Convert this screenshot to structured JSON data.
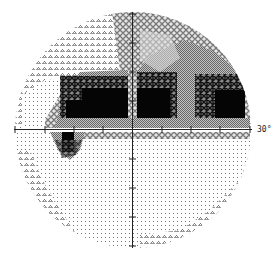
{
  "plot": {
    "type": "visual-field-greyscale",
    "scale_label": "30°",
    "center": {
      "x": 133,
      "y": 130
    },
    "radius": 118,
    "axis_colors": {
      "axis": "#222222"
    },
    "ticks_px": [
      -116,
      -87,
      -58,
      -29,
      29,
      58,
      87,
      116
    ],
    "tone_colors": {
      "blank": "#ffffff",
      "dots_sparse": "#bdbdbd",
      "dots": "#8a8a8a",
      "triangles": "#8c8c8c",
      "cross_hatch": "#9a9a9a",
      "grey_mid": "#8f8f8f",
      "grey_dark": "#6a6a6a",
      "dark_stars": "#2a2a2a",
      "black": "#050505"
    },
    "regions": [
      {
        "tone": "triangles",
        "shape": "upper-left-periphery"
      },
      {
        "tone": "dots",
        "shape": "lower-hemifield"
      },
      {
        "tone": "triangles",
        "shape": "lower-left-periphery"
      },
      {
        "tone": "triangles",
        "shape": "lower-right-periphery"
      },
      {
        "tone": "cross_hatch",
        "shape": "upper-right-arc"
      },
      {
        "tone": "grey_mid",
        "shape": "upper-right-mid"
      },
      {
        "tone": "black",
        "shape": "upper-left-central-block",
        "rect": [
          66,
          88,
          128,
          118
        ]
      },
      {
        "tone": "black",
        "shape": "upper-right-central-block",
        "rect": [
          137,
          88,
          170,
          118
        ]
      },
      {
        "tone": "black",
        "shape": "upper-right-temporal-block",
        "rect": [
          205,
          90,
          244,
          118
        ]
      },
      {
        "tone": "black",
        "shape": "lower-left-spot",
        "rect": [
          62,
          134,
          74,
          158
        ]
      }
    ]
  }
}
